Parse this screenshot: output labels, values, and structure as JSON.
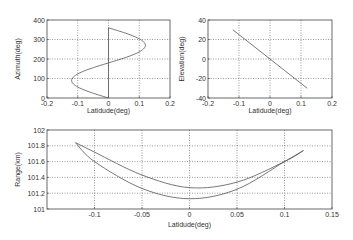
{
  "chart_data": [
    {
      "id": "azimuth",
      "type": "line",
      "title": "",
      "xlabel": "Latidude(deg)",
      "ylabel": "Azimuth(deg)",
      "xlim": [
        -0.2,
        0.2
      ],
      "ylim": [
        0,
        400
      ],
      "xticks": [
        -0.2,
        -0.1,
        0,
        0.1,
        0.2
      ],
      "xtick_labels": [
        "-0.2",
        "-0.1",
        "0",
        "0.1",
        "0.2"
      ],
      "yticks": [
        0,
        100,
        200,
        300,
        400
      ],
      "ytick_labels": [
        "0",
        "100",
        "200",
        "300",
        "400"
      ],
      "grid": true,
      "series": [
        {
          "name": "azimuth-curve",
          "x": [
            0,
            -0.06,
            -0.104,
            -0.12,
            -0.104,
            -0.06,
            0,
            0.06,
            0.104,
            0.12,
            0.104,
            0.06,
            0
          ],
          "y": [
            0,
            30,
            60,
            90,
            120,
            150,
            180,
            210,
            240,
            270,
            300,
            330,
            360
          ]
        },
        {
          "name": "zero-line",
          "x": [
            0,
            0
          ],
          "y": [
            0,
            360
          ]
        }
      ]
    },
    {
      "id": "elevation",
      "type": "line",
      "title": "",
      "xlabel": "Latidude(deg)",
      "ylabel": "Elevation(deg)",
      "xlim": [
        -0.2,
        0.2
      ],
      "ylim": [
        -40,
        40
      ],
      "xticks": [
        -0.2,
        -0.1,
        0,
        0.1,
        0.2
      ],
      "xtick_labels": [
        "-0.2",
        "-0.1",
        "0",
        "0.1",
        "0.2"
      ],
      "yticks": [
        -40,
        -20,
        0,
        20,
        40
      ],
      "ytick_labels": [
        "-40",
        "-20",
        "0",
        "20",
        "40"
      ],
      "grid": true,
      "series": [
        {
          "name": "elevation-line",
          "x": [
            -0.12,
            0.12
          ],
          "y": [
            30,
            -30
          ]
        }
      ]
    },
    {
      "id": "range",
      "type": "line",
      "title": "",
      "xlabel": "Latidude(deg)",
      "ylabel": "Range(km)",
      "xlim": [
        -0.15,
        0.15
      ],
      "ylim": [
        101,
        102
      ],
      "xticks": [
        -0.1,
        -0.05,
        0,
        0.05,
        0.1,
        0.15
      ],
      "xtick_labels": [
        "-0.1",
        "-0.05",
        "0",
        "0.05",
        "0.1",
        "0.15"
      ],
      "yticks": [
        101,
        101.2,
        101.4,
        101.6,
        101.8,
        102
      ],
      "ytick_labels": [
        "101",
        "101.2",
        "101.4",
        "101.6",
        "101.8",
        "102"
      ],
      "grid": true,
      "series": [
        {
          "name": "upper-branch",
          "x": [
            -0.12,
            -0.1,
            -0.05,
            0,
            0.05,
            0.1,
            0.12
          ],
          "y": [
            101.84,
            101.72,
            101.43,
            101.27,
            101.34,
            101.6,
            101.74
          ]
        },
        {
          "name": "lower-branch",
          "x": [
            -0.12,
            -0.1,
            -0.05,
            0,
            0.05,
            0.1,
            0.12
          ],
          "y": [
            101.84,
            101.6,
            101.26,
            101.13,
            101.25,
            101.6,
            101.74
          ]
        }
      ]
    }
  ]
}
